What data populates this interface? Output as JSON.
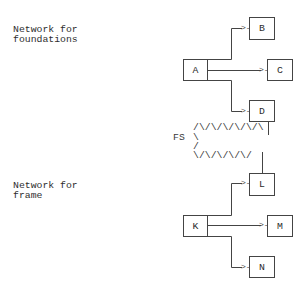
{
  "labels": {
    "foundations": "Network for\nfoundations",
    "frame": "Network for\nframe"
  },
  "network_foundations": {
    "source": "A",
    "targets": [
      "B",
      "C",
      "D"
    ]
  },
  "network_frame": {
    "source": "K",
    "targets": [
      "L",
      "M",
      "N"
    ]
  },
  "link": {
    "label": "FS",
    "row1": "/\\/\\/\\/\\/\\/\\",
    "row2": "\\",
    "row3": "/",
    "row4": "\\/\\/\\/\\/\\/"
  },
  "arrow_glyph": ">-",
  "colors": {
    "line": "#444444",
    "text": "#2e2e2e",
    "background": "#ffffff"
  }
}
